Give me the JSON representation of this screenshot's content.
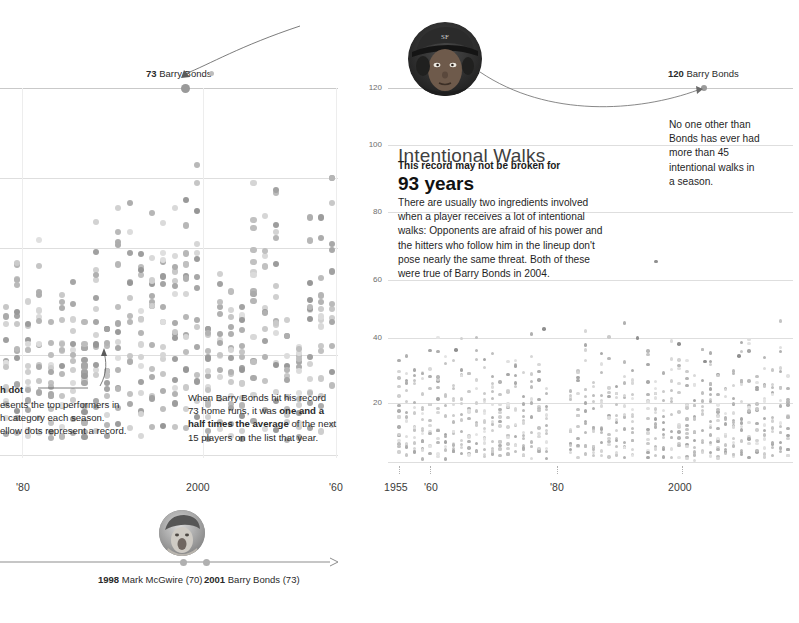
{
  "left_chart": {
    "record_label_value": "73",
    "record_label_name": "Barry Bonds",
    "x_ticks": [
      "'80",
      "2000",
      "'60"
    ],
    "annotation_eachdot": {
      "title": "h dot",
      "line1": "esents the top performers in",
      "line2": "h category each season.",
      "line3": "ellow dots represent a record."
    },
    "annotation_bonds": {
      "line1": "When Barry Bonds hit his record",
      "line2a": "73 home runs, it was ",
      "line2b": "one and a",
      "line3a": "half times the average",
      "line3b": " of the next",
      "line4": "15 players on the list that year."
    },
    "timeline": {
      "marker1_year": "1998",
      "marker1_text": "Mark McGwire (70)",
      "marker2_year": "2001",
      "marker2_text": "Barry Bonds (73)"
    }
  },
  "right_chart": {
    "headline": "Intentional Walks",
    "kicker": "This record may not be broken for",
    "bignum": "93 years",
    "body": "There are usually two ingredients involved when a player receives a lot of intentional walks: Opponents are afraid of his power and the hitters who follow him in the lineup don't pose nearly the same threat. Both of these were true of Barry Bonds in 2004.",
    "record_label_value": "120",
    "record_label_name": "Barry Bonds",
    "annotation": "No one other than Bonds has ever had more than 45 intentional walks in a season.",
    "y_ticks": [
      "120",
      "100",
      "80",
      "60",
      "40",
      "20"
    ],
    "x_ticks": [
      "1955",
      "'60",
      "'80",
      "2000"
    ]
  },
  "chart_data": {
    "type": "scatter",
    "charts": [
      {
        "id": "home-runs",
        "title": "Home Runs (left, cropped)",
        "ylim": [
          0,
          73
        ],
        "gridline_values": [
          73,
          60,
          50,
          40
        ],
        "xlim": [
          1977,
          2006
        ],
        "xtick_values": [
          1980,
          2000,
          2006
        ],
        "xtick_labels": [
          "'80",
          "2000",
          "'60"
        ],
        "record": {
          "year": 2001,
          "value": 73,
          "player": "Barry Bonds"
        },
        "note": "Dot plot: each season column holds the top 16 performers; highest dot is the season leader."
      },
      {
        "id": "intentional-walks",
        "title": "Intentional Walks",
        "ylabel": "Intentional walks",
        "ylim": [
          0,
          128
        ],
        "ytick_values": [
          120,
          100,
          80,
          60,
          40,
          20
        ],
        "xlim": [
          1955,
          2006
        ],
        "xtick_values": [
          1955,
          1960,
          1980,
          2000
        ],
        "xtick_labels": [
          "1955",
          "'60",
          "'80",
          "2000"
        ],
        "record": {
          "year": 2004,
          "value": 120,
          "player": "Barry Bonds"
        },
        "secondary_peaks": [
          {
            "year": 2002,
            "value": 68
          },
          {
            "year": 1969,
            "value": 45
          },
          {
            "year": 1959,
            "value": 38
          }
        ],
        "typical_leader_band": [
          25,
          35
        ],
        "median_band": [
          8,
          20
        ],
        "note": "Each season column holds the top performers in intentional walks; dots cluster between 5 and 25."
      }
    ]
  }
}
